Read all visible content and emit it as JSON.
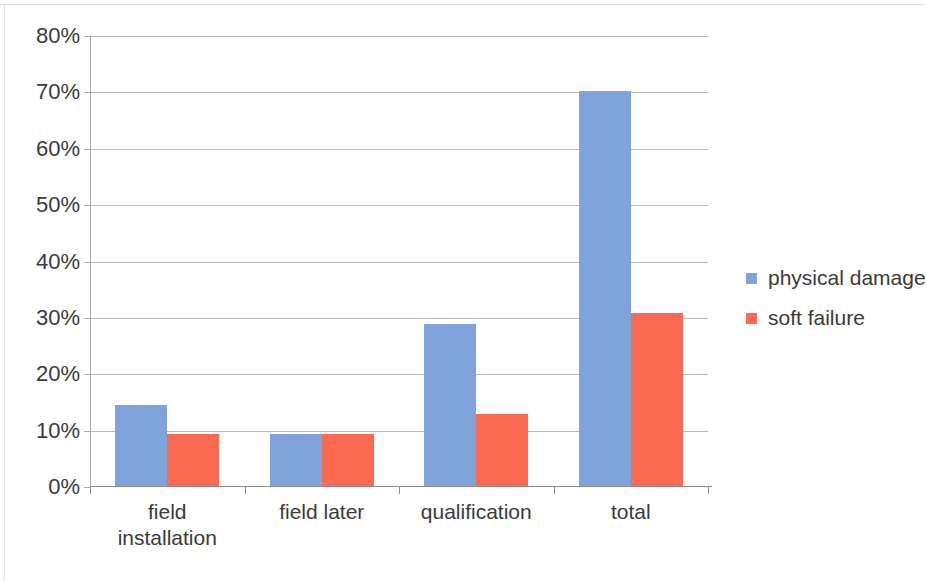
{
  "chart_data": {
    "type": "bar",
    "title": "",
    "xlabel": "",
    "ylabel": "",
    "categories": [
      "field installation",
      "field later",
      "qualification",
      "total"
    ],
    "category_lines": [
      [
        "field",
        "installation"
      ],
      [
        "field later"
      ],
      [
        "qualification"
      ],
      [
        "total"
      ]
    ],
    "series": [
      {
        "name": "physical damage",
        "color": "#7fa3da",
        "values": [
          14.3,
          9.2,
          28.8,
          70.0
        ]
      },
      {
        "name": "soft failure",
        "color": "#fa6a52",
        "values": [
          9.2,
          9.2,
          12.8,
          30.7
        ]
      }
    ],
    "ylim": [
      0,
      80
    ],
    "ytick_values": [
      0,
      10,
      20,
      30,
      40,
      50,
      60,
      70,
      80
    ],
    "ytick_labels": [
      "0%",
      "10%",
      "20%",
      "30%",
      "40%",
      "50%",
      "60%",
      "70%",
      "80%"
    ],
    "grid": true,
    "grid_axis": "y",
    "legend_position": "right",
    "legend_entries": [
      "physical damage",
      "soft failure"
    ]
  }
}
